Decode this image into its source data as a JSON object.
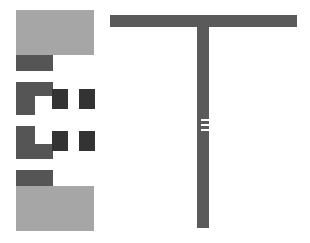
{
  "diagram": {
    "colors": {
      "light": "#a6a6a6",
      "medium": "#555555",
      "dark": "#333333",
      "stem": "#5a5a5a",
      "background": "#ffffff"
    },
    "left_stack": [
      {
        "name": "top-light-block",
        "x": 16,
        "y": 10,
        "w": 78,
        "h": 45,
        "tone": "light"
      },
      {
        "name": "top-dark-bar",
        "x": 16,
        "y": 55,
        "w": 37,
        "h": 16,
        "tone": "medium"
      },
      {
        "name": "upper-c-top",
        "x": 16,
        "y": 82,
        "w": 37,
        "h": 14,
        "tone": "medium"
      },
      {
        "name": "upper-c-left",
        "x": 16,
        "y": 96,
        "w": 19,
        "h": 19,
        "tone": "medium"
      },
      {
        "name": "upper-square-1",
        "x": 52,
        "y": 89,
        "w": 16,
        "h": 20,
        "tone": "dark"
      },
      {
        "name": "upper-square-2",
        "x": 79,
        "y": 89,
        "w": 16,
        "h": 20,
        "tone": "dark"
      },
      {
        "name": "lower-c-left",
        "x": 16,
        "y": 126,
        "w": 19,
        "h": 18,
        "tone": "medium"
      },
      {
        "name": "lower-c-bottom",
        "x": 16,
        "y": 144,
        "w": 37,
        "h": 15,
        "tone": "medium"
      },
      {
        "name": "lower-square-1",
        "x": 52,
        "y": 131,
        "w": 16,
        "h": 20,
        "tone": "dark"
      },
      {
        "name": "lower-square-2",
        "x": 79,
        "y": 131,
        "w": 16,
        "h": 20,
        "tone": "dark"
      },
      {
        "name": "bottom-dark-bar",
        "x": 16,
        "y": 170,
        "w": 37,
        "h": 16,
        "tone": "medium"
      },
      {
        "name": "bottom-light-block",
        "x": 16,
        "y": 186,
        "w": 78,
        "h": 45,
        "tone": "light"
      }
    ],
    "t_shape": {
      "top_bar": {
        "x": 110,
        "y": 15,
        "w": 187,
        "h": 12
      },
      "stem": {
        "x": 197,
        "y": 27,
        "w": 12,
        "h": 201
      },
      "notches": [
        {
          "x": 201,
          "y": 119,
          "w": 8,
          "h": 2
        },
        {
          "x": 201,
          "y": 124,
          "w": 8,
          "h": 2
        },
        {
          "x": 201,
          "y": 129,
          "w": 8,
          "h": 2
        }
      ]
    }
  }
}
